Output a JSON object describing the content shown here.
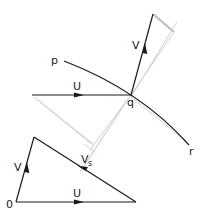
{
  "diagram": {
    "labels": {
      "p": "p",
      "q": "q",
      "r": "r",
      "U_top": "U",
      "V_top": "V",
      "V_tri": "V",
      "U_tri": "U",
      "Vs_main": "V",
      "Vs_sub": "s",
      "origin": "0"
    },
    "colors": {
      "ink": "#1a1a1a",
      "construction": "#c8c8c8"
    },
    "elements": [
      "curve p-q-r",
      "vector U arriving at q",
      "vector V leaving q",
      "velocity triangle O-V-U with Vs"
    ]
  }
}
